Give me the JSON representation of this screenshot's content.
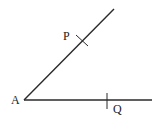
{
  "diagram": {
    "type": "angle-construction",
    "points": {
      "A": {
        "label": "A",
        "x": 24,
        "y": 100
      },
      "P": {
        "label": "P",
        "x": 82,
        "y": 41
      },
      "Q": {
        "label": "Q",
        "x": 107,
        "y": 100
      }
    },
    "rays": [
      {
        "from": "A",
        "to": [
          114,
          9
        ]
      },
      {
        "from": "A",
        "to": [
          152,
          100
        ]
      }
    ],
    "colors": {
      "line": "#2a2a2a",
      "text": "#222222"
    }
  }
}
